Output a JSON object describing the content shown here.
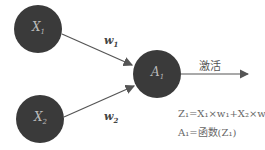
{
  "nodes": [
    {
      "id": "x1",
      "label": "X",
      "sub": "1"
    },
    {
      "id": "x2",
      "label": "X",
      "sub": "2"
    },
    {
      "id": "a1",
      "label": "A",
      "sub": "1"
    }
  ],
  "weights": [
    {
      "label": "w",
      "sub": "1"
    },
    {
      "label": "w",
      "sub": "2"
    }
  ],
  "activation_label": "激活",
  "equations": {
    "z": "Z₁=X₁×w₁+X₂×w₂",
    "a": "A₁=函数(Z₁)"
  },
  "colors": {
    "node": "#3a3a3a",
    "arrow": "#555555"
  }
}
